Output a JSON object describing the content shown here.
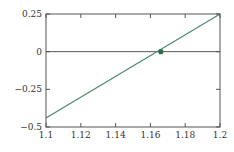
{
  "chart_data": {
    "type": "line",
    "title": "",
    "xlabel": "",
    "ylabel": "",
    "xlim": [
      1.1,
      1.2
    ],
    "ylim": [
      -0.5,
      0.25
    ],
    "grid": false,
    "x_ticks": [
      "1.1",
      "1.12",
      "1.14",
      "1.16",
      "1.18",
      "1.2"
    ],
    "y_ticks": [
      "0.25",
      "0",
      "−0.25",
      "−0.5"
    ],
    "series": [
      {
        "name": "line",
        "x": [
          1.1,
          1.2
        ],
        "y": [
          -0.44,
          0.25
        ],
        "color": "#4a8a6a"
      }
    ],
    "reference_lines": [
      {
        "type": "horizontal",
        "y": 0,
        "color": "#555555"
      }
    ],
    "markers": [
      {
        "x": 1.166,
        "y": 0,
        "color": "#2f6b4f",
        "label": "root"
      }
    ]
  },
  "colors": {
    "axis": "#555555",
    "line": "#4a8a6a",
    "marker": "#2f6b4f"
  }
}
